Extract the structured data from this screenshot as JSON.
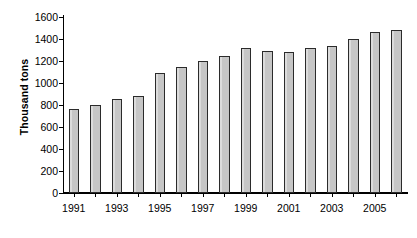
{
  "chart_data": {
    "type": "bar",
    "title": "",
    "xlabel": "",
    "ylabel": "Thousand tons",
    "ylim": [
      0,
      1600
    ],
    "y_ticks": [
      0,
      200,
      400,
      600,
      800,
      1000,
      1200,
      1400,
      1600
    ],
    "y_tick_labels": [
      "0",
      "200",
      "400",
      "600",
      "800",
      "1000",
      "1200",
      "1400",
      "1600"
    ],
    "grid": false,
    "legend": null,
    "categories": [
      "1991",
      "1992",
      "1993",
      "1994",
      "1995",
      "1996",
      "1997",
      "1998",
      "1999",
      "2000",
      "2001",
      "2002",
      "2003",
      "2004",
      "2005",
      "2006"
    ],
    "x_tick_labels": [
      "1991",
      "1993",
      "1995",
      "1997",
      "1999",
      "2001",
      "2003",
      "2005"
    ],
    "values": [
      765,
      800,
      855,
      880,
      1090,
      1150,
      1200,
      1243,
      1322,
      1288,
      1280,
      1322,
      1332,
      1400,
      1468,
      1478
    ],
    "bar_fill_color": "#c9c9c9",
    "bar_border_color": "#2b2b2b",
    "axis_color": "#000000",
    "background_color": "#ffffff"
  }
}
